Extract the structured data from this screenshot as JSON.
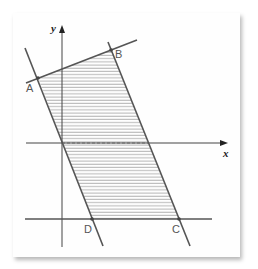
{
  "figure": {
    "axes": {
      "x_label": "x",
      "y_label": "y"
    },
    "points": [
      {
        "name": "A",
        "label": "A"
      },
      {
        "name": "B",
        "label": "B"
      },
      {
        "name": "C",
        "label": "C"
      },
      {
        "name": "D",
        "label": "D"
      }
    ],
    "region": {
      "vertices": [
        "A",
        "B",
        "C",
        "D"
      ],
      "fill": "hatched"
    },
    "colors": {
      "line": "#555555",
      "axis": "#444444",
      "hatch": "#8a8a8a",
      "card": "#fefefe"
    }
  }
}
